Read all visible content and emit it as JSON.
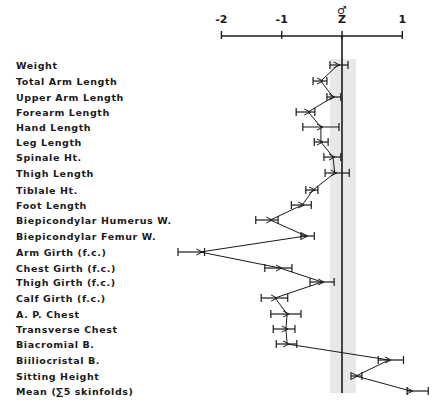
{
  "chart_data": {
    "type": "scatter",
    "subtype": "horizontal profile plot with error bars",
    "title": "",
    "group_symbol": "♂",
    "xlabel": "Z",
    "ylabel": "",
    "xlim": [
      -2.4,
      1.5
    ],
    "x_ticks": [
      -2,
      -1,
      0,
      1
    ],
    "x_tick_labels": [
      "-2",
      "-1",
      "Z",
      "1"
    ],
    "reference_line": 0,
    "shaded_band": [
      -0.2,
      0.23
    ],
    "grid": false,
    "legend": null,
    "categories": [
      "Weight",
      "Total Arm Length",
      "Upper Arm Length",
      "Forearm Length",
      "Hand Length",
      "Leg Length",
      "Spinale Ht.",
      "Thigh Length",
      "Tiblale Ht.",
      "Foot Length",
      "Biepicondylar Humerus W.",
      "Biepicondylar Femur W.",
      "Arm Girth (f.c.)",
      "Chest Girth (f.c.)",
      "Thigh Girth (f.c.)",
      "Calf Girth (f.c.)",
      "A. P. Chest",
      "Transverse Chest",
      "Biacromial B.",
      "Biiliocristal B.",
      "Sitting Height",
      "Mean (∑5 skinfolds)"
    ],
    "series": [
      {
        "name": "Z-score mean",
        "values": [
          -0.07,
          -0.35,
          -0.15,
          -0.56,
          -0.35,
          -0.35,
          -0.15,
          -0.12,
          -0.48,
          -0.66,
          -1.19,
          -0.6,
          -2.35,
          -1.03,
          -0.33,
          -1.11,
          -0.91,
          -0.93,
          -0.91,
          0.78,
          0.23,
          1.14
        ],
        "error_low": [
          -0.2,
          -0.48,
          -0.25,
          -0.76,
          -0.65,
          -0.46,
          -0.3,
          -0.28,
          -0.6,
          -0.84,
          -1.43,
          -0.68,
          -2.72,
          -1.28,
          -0.53,
          -1.34,
          -1.18,
          -1.14,
          -1.09,
          0.6,
          0.15,
          1.08
        ],
        "error_high": [
          0.1,
          -0.25,
          -0.02,
          -0.45,
          -0.05,
          -0.23,
          -0.02,
          0.12,
          -0.4,
          -0.51,
          -1.06,
          -0.46,
          -2.28,
          -0.83,
          -0.13,
          -0.9,
          -0.68,
          -0.78,
          -0.75,
          1.02,
          0.33,
          1.43
        ]
      }
    ]
  },
  "layout": {
    "x_zero_px": 342,
    "px_per_unit": 60.3,
    "axis_y_px": 36,
    "row_y_px": [
      65,
      81,
      97,
      112,
      127,
      142,
      157,
      173,
      190,
      205,
      220,
      236,
      252,
      268,
      282,
      298,
      314,
      329,
      344,
      360,
      376,
      391
    ],
    "line_color": "#1a1a1a",
    "band_color": "#d6d6d6"
  }
}
